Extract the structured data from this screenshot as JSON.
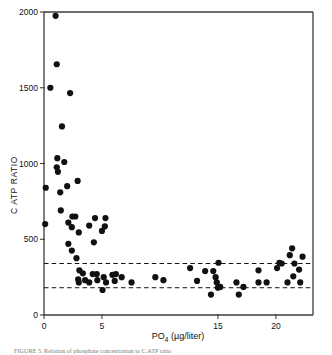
{
  "figure": {
    "caption": "FIGURE 5.  Relation of phosphate concentration to C:ATP ratio"
  },
  "chart_data": {
    "type": "scatter",
    "title": "",
    "xlabel": "PO4 (µg/liter)",
    "xlabel_base": "PO",
    "xlabel_sub": "4",
    "xlabel_units": " (µg/liter)",
    "ylabel": "C ATP RATIO",
    "xlim": [
      0,
      23.2
    ],
    "ylim": [
      0,
      2000
    ],
    "xticks": [
      0,
      5,
      15,
      20
    ],
    "xticklabels": [
      "0",
      "5",
      "15",
      "20"
    ],
    "yticks": [
      0,
      500,
      1000,
      1500,
      2000
    ],
    "yticklabels": [
      "0",
      "500",
      "1000",
      "1500",
      "2000"
    ],
    "grid": false,
    "legend": "none",
    "marker": "filled-circle",
    "marker_color": "#111111",
    "marker_size_px": 3.1,
    "reference_lines": [
      {
        "name": "upper-dashed-line",
        "y": 340,
        "style": "dashed",
        "color": "#111111"
      },
      {
        "name": "lower-dashed-line",
        "y": 180,
        "style": "dashed",
        "color": "#111111"
      }
    ],
    "points": [
      [
        1.0,
        1975
      ],
      [
        1.1,
        1655
      ],
      [
        0.55,
        1500
      ],
      [
        2.25,
        1465
      ],
      [
        1.55,
        1245
      ],
      [
        1.15,
        1035
      ],
      [
        1.75,
        1010
      ],
      [
        1.1,
        975
      ],
      [
        1.2,
        945
      ],
      [
        2.9,
        885
      ],
      [
        0.15,
        840
      ],
      [
        2.0,
        850
      ],
      [
        1.4,
        810
      ],
      [
        1.45,
        690
      ],
      [
        2.45,
        650
      ],
      [
        2.7,
        650
      ],
      [
        4.4,
        640
      ],
      [
        5.3,
        640
      ],
      [
        2.1,
        610
      ],
      [
        0.1,
        600
      ],
      [
        3.9,
        590
      ],
      [
        5.25,
        585
      ],
      [
        2.4,
        580
      ],
      [
        5.0,
        555
      ],
      [
        3.0,
        545
      ],
      [
        2.1,
        470
      ],
      [
        4.3,
        480
      ],
      [
        2.4,
        425
      ],
      [
        2.8,
        375
      ],
      [
        3.05,
        295
      ],
      [
        3.35,
        275
      ],
      [
        4.2,
        270
      ],
      [
        2.95,
        235
      ],
      [
        3.0,
        215
      ],
      [
        3.55,
        230
      ],
      [
        3.9,
        215
      ],
      [
        4.55,
        270
      ],
      [
        4.6,
        230
      ],
      [
        5.15,
        250
      ],
      [
        5.35,
        215
      ],
      [
        5.05,
        165
      ],
      [
        5.9,
        265
      ],
      [
        6.2,
        270
      ],
      [
        6.1,
        225
      ],
      [
        6.7,
        250
      ],
      [
        7.55,
        215
      ],
      [
        9.6,
        250
      ],
      [
        10.3,
        230
      ],
      [
        13.2,
        225
      ],
      [
        13.9,
        290
      ],
      [
        12.6,
        310
      ],
      [
        14.6,
        290
      ],
      [
        14.8,
        250
      ],
      [
        15.05,
        345
      ],
      [
        14.9,
        215
      ],
      [
        15.2,
        185
      ],
      [
        15.0,
        180
      ],
      [
        14.4,
        135
      ],
      [
        16.6,
        215
      ],
      [
        17.2,
        185
      ],
      [
        16.8,
        135
      ],
      [
        18.5,
        295
      ],
      [
        18.5,
        215
      ],
      [
        19.2,
        215
      ],
      [
        20.1,
        310
      ],
      [
        20.3,
        345
      ],
      [
        20.5,
        340
      ],
      [
        21.0,
        215
      ],
      [
        21.2,
        395
      ],
      [
        21.4,
        440
      ],
      [
        21.6,
        340
      ],
      [
        21.5,
        255
      ],
      [
        22.0,
        300
      ],
      [
        22.1,
        215
      ],
      [
        22.3,
        385
      ]
    ]
  }
}
